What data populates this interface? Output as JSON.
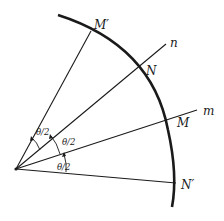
{
  "diagram": {
    "type": "geometry-reflection-angles",
    "points": {
      "M_prime": "M′",
      "N": "N",
      "M": "M",
      "N_prime": "N′"
    },
    "lines": {
      "n": "n",
      "m": "m"
    },
    "angle_labels": [
      "θ/2",
      "θ/2",
      "θ/2"
    ],
    "colors": {
      "stroke": "#1a1a1a",
      "background": "#ffffff"
    }
  }
}
